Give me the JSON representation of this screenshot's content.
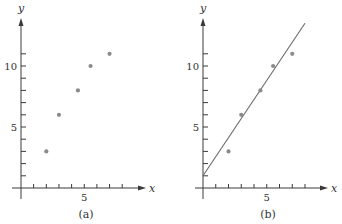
{
  "chart_data": [
    {
      "type": "scatter",
      "panel_label": "(a)",
      "xlabel": "x",
      "ylabel": "y",
      "x_ticks": [
        1,
        2,
        3,
        4,
        5,
        6,
        7,
        8
      ],
      "x_tick_labels": {
        "5": "5"
      },
      "y_ticks": [
        1,
        2,
        3,
        4,
        5,
        6,
        7,
        8,
        9,
        10,
        11
      ],
      "y_tick_labels": {
        "5": "5",
        "10": "10"
      },
      "xlim": [
        0,
        9.8
      ],
      "ylim": [
        0,
        14
      ],
      "grid": false,
      "points": [
        {
          "x": 2,
          "y": 3
        },
        {
          "x": 3,
          "y": 6
        },
        {
          "x": 4.5,
          "y": 8
        },
        {
          "x": 5.5,
          "y": 10
        },
        {
          "x": 7,
          "y": 11
        }
      ]
    },
    {
      "type": "scatter",
      "panel_label": "(b)",
      "xlabel": "x",
      "ylabel": "y",
      "x_ticks": [
        1,
        2,
        3,
        4,
        5,
        6,
        7,
        8
      ],
      "x_tick_labels": {
        "5": "5"
      },
      "y_ticks": [
        1,
        2,
        3,
        4,
        5,
        6,
        7,
        8,
        9,
        10,
        11
      ],
      "y_tick_labels": {
        "5": "5",
        "10": "10"
      },
      "xlim": [
        0,
        9.8
      ],
      "ylim": [
        0,
        14
      ],
      "grid": false,
      "points": [
        {
          "x": 2,
          "y": 3
        },
        {
          "x": 3,
          "y": 6
        },
        {
          "x": 4.5,
          "y": 8
        },
        {
          "x": 5.5,
          "y": 10
        },
        {
          "x": 7,
          "y": 11
        }
      ],
      "fit_line": {
        "x0": 0,
        "y0": 1,
        "x1": 8,
        "y1": 13.5,
        "slope": 1.56,
        "intercept": 1
      }
    }
  ],
  "figure": {
    "panels": [
      {
        "label": "(a)"
      },
      {
        "label": "(b)"
      }
    ],
    "colors": {
      "axis": "#3a3a3a",
      "points": "#8a8a8a",
      "line": "#6a6a6a"
    }
  }
}
